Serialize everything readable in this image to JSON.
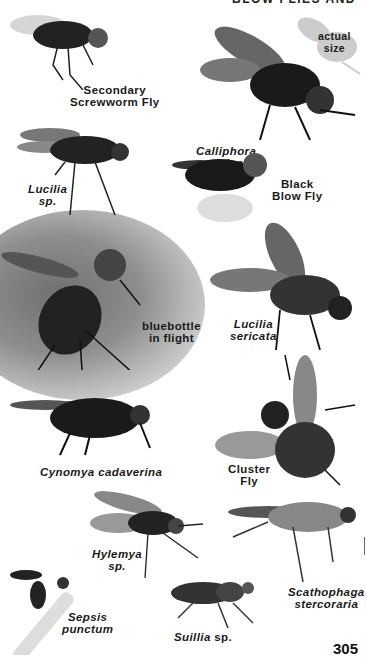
{
  "page": {
    "header": "BLOW FLIES AND OTHERS",
    "page_number": "305"
  },
  "actual_size_note": {
    "line1": "actual",
    "line2": "size"
  },
  "species": [
    {
      "id": "secondary-screwworm",
      "line1": "Secondary",
      "line2": "Screwworm Fly",
      "italic": false
    },
    {
      "id": "calliphora-vicina",
      "line1": "Calliphora",
      "line2": "vicina",
      "italic": true
    },
    {
      "id": "lucilia-sp",
      "line1": "Lucilia",
      "line2": "sp.",
      "italic": true
    },
    {
      "id": "black-blow-fly",
      "line1": "Black",
      "line2": "Blow Fly",
      "italic": false
    },
    {
      "id": "bluebottle",
      "line1": "bluebottle",
      "line2": "in flight",
      "italic": false
    },
    {
      "id": "lucilia-sericata",
      "line1": "Lucilia",
      "line2": "sericata",
      "italic": true
    },
    {
      "id": "cynomya-cadaverina",
      "line1": "Cynomya cadaverina",
      "line2": "",
      "italic": true
    },
    {
      "id": "cluster-fly",
      "line1": "Cluster",
      "line2": "Fly",
      "italic": false
    },
    {
      "id": "hylemya-sp",
      "line1": "Hylemya",
      "line2": "sp.",
      "italic": true
    },
    {
      "id": "scathophaga-stercoraria",
      "line1": "Scathophaga",
      "line2": "stercoraria",
      "italic": true
    },
    {
      "id": "sepsis-punctum",
      "line1": "Sepsis",
      "line2": "punctum",
      "italic": true
    },
    {
      "id": "suillia-sp",
      "line1": "Suillia",
      "line2": "sp.",
      "italic": false,
      "mixed": "Suillia italic, sp. roman"
    }
  ]
}
